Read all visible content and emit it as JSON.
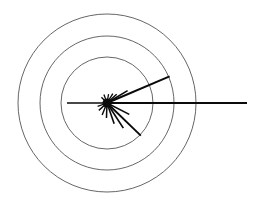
{
  "figure": {
    "title": "",
    "background_color": "#ffffff",
    "width": 254,
    "height": 205
  },
  "chart_data": {
    "type": "scatter",
    "plot_style": "polar-star-rose",
    "title": "",
    "subtitle": "",
    "xlabel": "",
    "ylabel": "",
    "legend": [],
    "annotations": [],
    "grid": true,
    "grid_label": "concentric-circles",
    "tick_labels": [],
    "center": {
      "x": 107,
      "y": 103
    },
    "grid_circles": {
      "stroke_color": "#555555",
      "stroke_width": 0.9,
      "radii": [
        46,
        67,
        89
      ],
      "count": 3
    },
    "rays": {
      "stroke_color": "#0a0a0a",
      "count": 17,
      "hub_radius": 4.5,
      "items": [
        {
          "name": "ray-east-long",
          "angle_deg": 0,
          "length": 140,
          "width": 1.8
        },
        {
          "name": "ray-west",
          "angle_deg": 180,
          "length": 40,
          "width": 1.6
        },
        {
          "name": "ray-ene-long",
          "angle_deg": 23,
          "length": 68,
          "width": 2.0
        },
        {
          "name": "ray-ene-short",
          "angle_deg": 31,
          "length": 24,
          "width": 1.6
        },
        {
          "name": "ray-ne-tick",
          "angle_deg": 42,
          "length": 13,
          "width": 1.5
        },
        {
          "name": "ray-nne",
          "angle_deg": 58,
          "length": 11,
          "width": 1.4
        },
        {
          "name": "ray-north",
          "angle_deg": 80,
          "length": 9,
          "width": 1.3
        },
        {
          "name": "ray-nnw",
          "angle_deg": 110,
          "length": 9,
          "width": 1.3
        },
        {
          "name": "ray-nw",
          "angle_deg": 134,
          "length": 8,
          "width": 1.3
        },
        {
          "name": "ray-wsw",
          "angle_deg": 200,
          "length": 10,
          "width": 1.3
        },
        {
          "name": "ray-sw",
          "angle_deg": 222,
          "length": 11,
          "width": 1.4
        },
        {
          "name": "ray-ssw",
          "angle_deg": 248,
          "length": 13,
          "width": 1.4
        },
        {
          "name": "ray-south",
          "angle_deg": 268,
          "length": 15,
          "width": 1.5
        },
        {
          "name": "ray-sse",
          "angle_deg": 289,
          "length": 22,
          "width": 1.6
        },
        {
          "name": "ray-se-medium",
          "angle_deg": 303,
          "length": 30,
          "width": 1.7
        },
        {
          "name": "ray-se-long",
          "angle_deg": 316,
          "length": 47,
          "width": 1.9
        },
        {
          "name": "ray-ese",
          "angle_deg": 333,
          "length": 25,
          "width": 1.6
        }
      ]
    }
  }
}
